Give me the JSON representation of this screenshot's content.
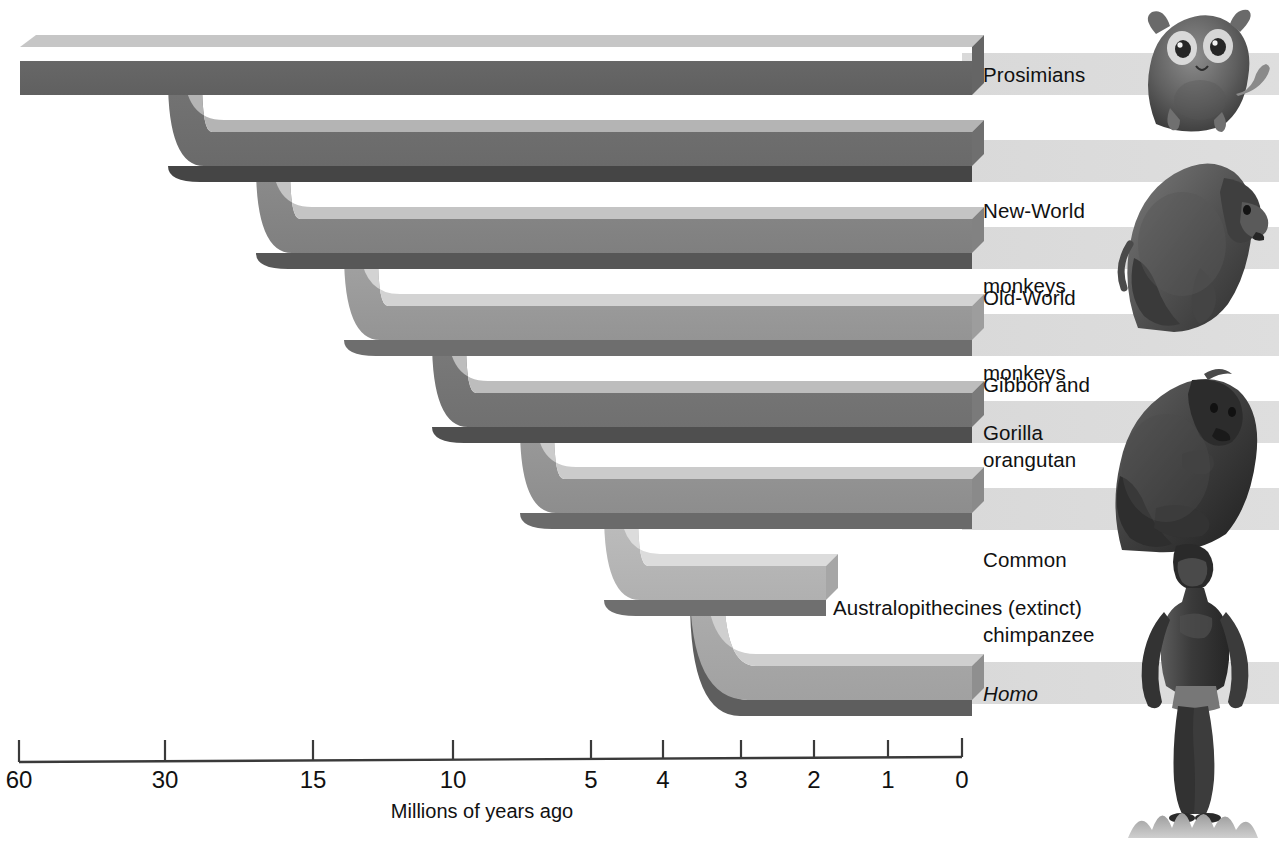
{
  "figure": {
    "type": "phylogenetic-tree",
    "axis_caption": "Millions of years ago"
  },
  "axis": {
    "caption": "Millions of years ago",
    "ticks": [
      {
        "label": "60",
        "value": 60,
        "x": 19
      },
      {
        "label": "30",
        "value": 30,
        "x": 165
      },
      {
        "label": "15",
        "value": 15,
        "x": 313
      },
      {
        "label": "10",
        "value": 10,
        "x": 453
      },
      {
        "label": "5",
        "value": 5,
        "x": 591
      },
      {
        "label": "4",
        "value": 4,
        "x": 663
      },
      {
        "label": "3",
        "value": 3,
        "x": 741
      },
      {
        "label": "2",
        "value": 2,
        "x": 814
      },
      {
        "label": "1",
        "value": 1,
        "x": 888
      },
      {
        "label": "0",
        "value": 0,
        "x": 962
      }
    ],
    "line_y": 760,
    "tick_top": 740,
    "caption_x": 482,
    "caption_y": 800
  },
  "tips": [
    {
      "id": "prosimians",
      "label": "Prosimians",
      "y": 84,
      "band_end": 962,
      "divergence_mya": 60,
      "italic": false,
      "label_x": 983,
      "label_y": 62,
      "label_lines": [
        "Prosimians"
      ]
    },
    {
      "id": "new-world-monkeys",
      "label": "New-World monkeys",
      "y": 170,
      "band_end": 962,
      "divergence_mya": 40,
      "italic": false,
      "label_x": 983,
      "label_y": 148,
      "label_lines": [
        "New-World",
        "monkeys"
      ]
    },
    {
      "id": "old-world-monkeys",
      "label": "Old-World monkeys",
      "y": 257,
      "band_end": 962,
      "divergence_mya": 30,
      "italic": false,
      "label_x": 983,
      "label_y": 235,
      "label_lines": [
        "Old-World",
        "monkeys"
      ]
    },
    {
      "id": "gibbon-orangutan",
      "label": "Gibbon and orangutan",
      "y": 345,
      "band_end": 962,
      "divergence_mya": 20,
      "italic": false,
      "label_x": 983,
      "label_y": 323,
      "label_lines": [
        "Gibbon and",
        "orangutan"
      ]
    },
    {
      "id": "gorilla",
      "label": "Gorilla",
      "y": 432,
      "band_end": 962,
      "divergence_mya": 9,
      "italic": false,
      "label_x": 983,
      "label_y": 420,
      "label_lines": [
        "Gorilla"
      ]
    },
    {
      "id": "common-chimpanzee",
      "label": "Common chimpanzee",
      "y": 519,
      "band_end": 962,
      "divergence_mya": 6,
      "italic": false,
      "label_x": 983,
      "label_y": 497,
      "label_lines": [
        "Common",
        "chimpanzee"
      ]
    },
    {
      "id": "australopithecines",
      "label": "Australopithecines (extinct)",
      "y": 606,
      "band_end": 823,
      "divergence_mya": 5,
      "italic": false,
      "label_x": 833,
      "label_y": 595,
      "label_lines": [
        "Australopithecines (extinct)"
      ]
    },
    {
      "id": "homo",
      "label": "Homo",
      "y": 693,
      "band_end": 968,
      "divergence_mya": 2.5,
      "italic": true,
      "label_x": 983,
      "label_y": 682,
      "label_lines": [
        "Homo"
      ]
    }
  ],
  "nodes": [
    {
      "id": "root",
      "x": 20,
      "note": "base of tree, ~60 mya"
    },
    {
      "id": "split-1",
      "x": 110,
      "splits": [
        "prosimians",
        "rest"
      ]
    },
    {
      "id": "split-2",
      "x": 200,
      "splits": [
        "new-world-monkeys",
        "rest"
      ]
    },
    {
      "id": "split-3",
      "x": 290,
      "splits": [
        "old-world-monkeys",
        "rest"
      ]
    },
    {
      "id": "split-4",
      "x": 400,
      "splits": [
        "gibbon-orangutan",
        "rest"
      ]
    },
    {
      "id": "split-5",
      "x": 520,
      "splits": [
        "gorilla",
        "rest"
      ]
    },
    {
      "id": "split-6",
      "x": 610,
      "splits": [
        "common-chimpanzee",
        "rest"
      ]
    },
    {
      "id": "split-7",
      "x": 700,
      "splits": [
        "australopithecines",
        "homo"
      ]
    }
  ],
  "illustrations": [
    {
      "id": "tarsier",
      "name": "tarsier-illustration",
      "x": 1126,
      "y": 6,
      "w": 152,
      "h": 126
    },
    {
      "id": "baboon",
      "name": "baboon-illustration",
      "x": 1108,
      "y": 150,
      "w": 168,
      "h": 180
    },
    {
      "id": "gorilla",
      "name": "gorilla-illustration",
      "x": 1100,
      "y": 360,
      "w": 172,
      "h": 192
    },
    {
      "id": "human",
      "name": "human-illustration",
      "x": 1118,
      "y": 545,
      "w": 150,
      "h": 290
    }
  ],
  "colors": {
    "band_dark": "#6f6f6f",
    "band_mid": "#8a8a8a",
    "band_light": "#a8a8a8",
    "bevel_top": "#c9c9c9",
    "bevel_shadow": "#4a4a4a",
    "label_strip": "#d6d6d6",
    "text": "#111111",
    "axis": "#222222",
    "background": "#ffffff"
  }
}
